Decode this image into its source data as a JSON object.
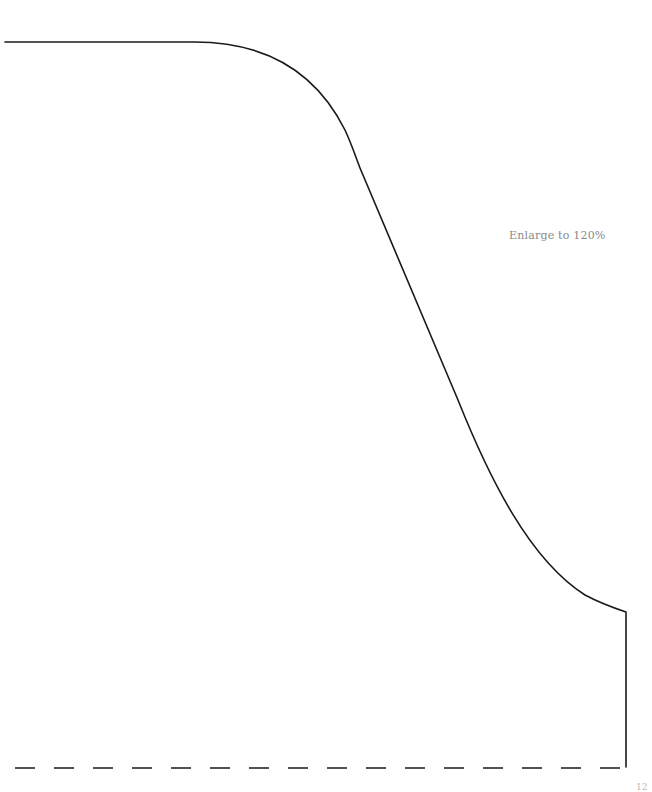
{
  "page": {
    "instruction_note": "Enlarge to 120%",
    "page_number": "12"
  },
  "pattern": {
    "stroke_color": "#1a1a1a",
    "outline_style": "solid",
    "fold_line_style": "dashed"
  }
}
